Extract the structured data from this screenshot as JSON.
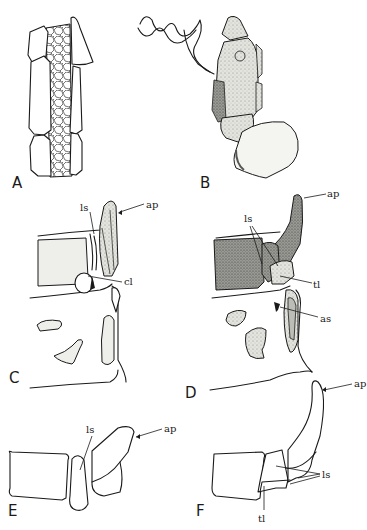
{
  "figure": {
    "panels": [
      {
        "id": "A",
        "label": "A",
        "annotations": []
      },
      {
        "id": "B",
        "label": "B",
        "annotations": []
      },
      {
        "id": "C",
        "label": "C",
        "annotations": [
          "ls",
          "ap",
          "cl"
        ]
      },
      {
        "id": "D",
        "label": "D",
        "annotations": [
          "ls",
          "ap",
          "tl",
          "as"
        ]
      },
      {
        "id": "E",
        "label": "E",
        "annotations": [
          "ls",
          "ap"
        ]
      },
      {
        "id": "F",
        "label": "F",
        "annotations": [
          "ap",
          "ls",
          "tl"
        ]
      }
    ],
    "labels": {
      "A": "A",
      "B": "B",
      "C": "C",
      "D": "D",
      "E": "E",
      "F": "F",
      "c_ls": "ls",
      "c_ap": "ap",
      "c_cl": "cl",
      "d_ls": "ls",
      "d_ap": "ap",
      "d_tl": "tl",
      "d_as": "as",
      "e_ls": "ls",
      "e_ap": "ap",
      "f_ap": "ap",
      "f_ls": "ls",
      "f_tl": "tl"
    }
  }
}
